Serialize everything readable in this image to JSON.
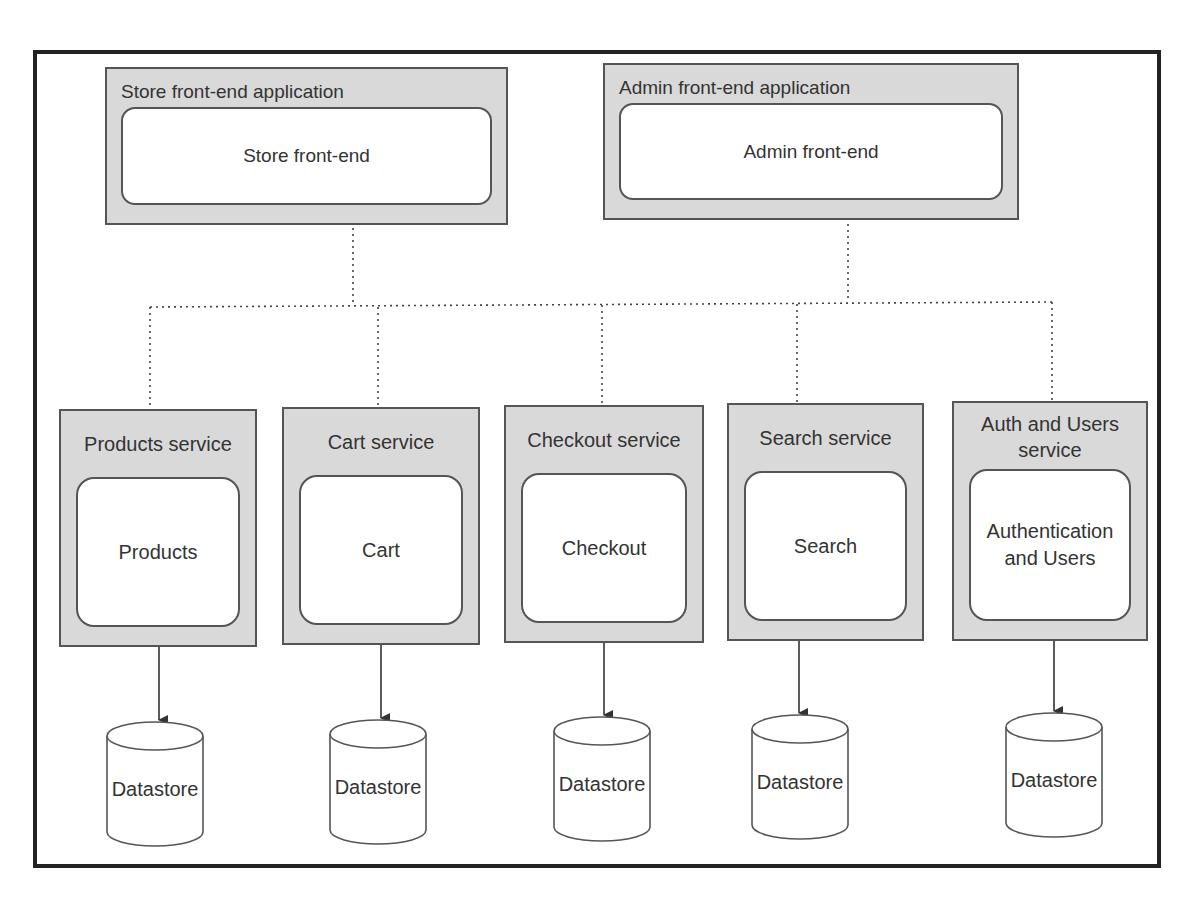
{
  "diagram": {
    "title": "",
    "frontends": [
      {
        "container_label": "Store front-end application",
        "component_label": "Store front-end"
      },
      {
        "container_label": "Admin front-end application",
        "component_label": "Admin front-end"
      }
    ],
    "services": [
      {
        "container_label": "Products service",
        "component_label": "Products",
        "datastore_label": "Datastore"
      },
      {
        "container_label": "Cart service",
        "component_label": "Cart",
        "datastore_label": "Datastore"
      },
      {
        "container_label": "Checkout service",
        "component_label": "Checkout",
        "datastore_label": "Datastore"
      },
      {
        "container_label": "Search service",
        "component_label": "Search",
        "datastore_label": "Datastore"
      },
      {
        "container_label": "Auth and Users service",
        "component_label": "Authentication and Users",
        "datastore_label": "Datastore"
      }
    ],
    "edges": [
      {
        "from": "Store front-end application",
        "to": "service bus",
        "style": "dotted"
      },
      {
        "from": "Admin front-end application",
        "to": "service bus",
        "style": "dotted"
      },
      {
        "from": "service bus",
        "to": "Products service",
        "style": "dotted"
      },
      {
        "from": "service bus",
        "to": "Cart service",
        "style": "dotted"
      },
      {
        "from": "service bus",
        "to": "Checkout service",
        "style": "dotted"
      },
      {
        "from": "service bus",
        "to": "Search service",
        "style": "dotted"
      },
      {
        "from": "service bus",
        "to": "Auth and Users service",
        "style": "dotted"
      },
      {
        "from": "Products service",
        "to": "Datastore",
        "style": "solid-arrow"
      },
      {
        "from": "Cart service",
        "to": "Datastore",
        "style": "solid-arrow"
      },
      {
        "from": "Checkout service",
        "to": "Datastore",
        "style": "solid-arrow"
      },
      {
        "from": "Search service",
        "to": "Datastore",
        "style": "solid-arrow"
      },
      {
        "from": "Auth and Users service",
        "to": "Datastore",
        "style": "solid-arrow"
      }
    ],
    "colors": {
      "container_fill": "#d9d9d9",
      "border": "#555555",
      "frame": "#222222",
      "inner_fill": "#ffffff"
    }
  }
}
